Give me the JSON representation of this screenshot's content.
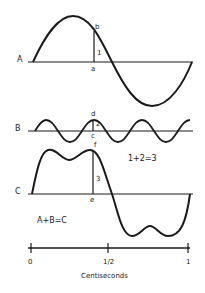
{
  "waves": {
    "A": {
      "label": "A"
    },
    "B": {
      "label": "B"
    },
    "C": {
      "label": "C"
    }
  },
  "points": {
    "a": "a",
    "b": "b",
    "c": "c",
    "d": "d",
    "e": "e",
    "f": "f"
  },
  "segments": {
    "one": "1",
    "two": "2",
    "three": "3"
  },
  "equations": {
    "segment_sum": "1+2=3",
    "wave_sum": "A+B=C"
  },
  "axis": {
    "ticks": [
      "0",
      "1/2",
      "1"
    ],
    "label": "Centiseconds"
  },
  "colors": {
    "ink": "#1a1a1a",
    "background": "#ffffff"
  }
}
